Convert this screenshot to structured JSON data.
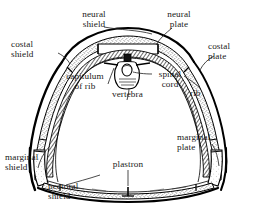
{
  "figure": {
    "caption": "",
    "line_color": "#000000",
    "fill_color": "#ffffff",
    "text_color": "#191919",
    "background": "#ffffff",
    "width": 256,
    "height": 206
  },
  "labels": {
    "neural_shield": "neural\nshield",
    "neural_shield_l1": "neural",
    "neural_shield_l2": "shield",
    "neural_plate_l1": "neural",
    "neural_plate_l2": "plate",
    "costal_shield_l1": "costal",
    "costal_shield_l2": "shield",
    "costal_plate_l1": "costal",
    "costal_plate_l2": "plate",
    "capitulum_l1": "capitulum",
    "capitulum_l2": "of rib",
    "spinal_cord_l1": "spinal",
    "spinal_cord_l2": "cord",
    "vertebra": "vertebra",
    "rib": "rib",
    "marginal_shield_l1": "marginal",
    "marginal_shield_l2": "shield",
    "marginal_plate_l1": "marginal",
    "marginal_plate_l2": "plate",
    "plastron": "plastron",
    "pectoral_shield_l1": "pectoral",
    "pectoral_shield_l2": "shield"
  },
  "parts": [
    {
      "id": "neural-shield",
      "name": "neural shield"
    },
    {
      "id": "neural-plate",
      "name": "neural plate"
    },
    {
      "id": "costal-shield",
      "name": "costal shield"
    },
    {
      "id": "costal-plate",
      "name": "costal plate"
    },
    {
      "id": "capitulum-of-rib",
      "name": "capitulum of rib"
    },
    {
      "id": "spinal-cord",
      "name": "spinal cord"
    },
    {
      "id": "vertebra",
      "name": "vertebra"
    },
    {
      "id": "rib",
      "name": "rib"
    },
    {
      "id": "marginal-shield",
      "name": "marginal shield"
    },
    {
      "id": "marginal-plate",
      "name": "marginal plate"
    },
    {
      "id": "plastron",
      "name": "plastron"
    },
    {
      "id": "pectoral-shield",
      "name": "pectoral shield"
    }
  ]
}
